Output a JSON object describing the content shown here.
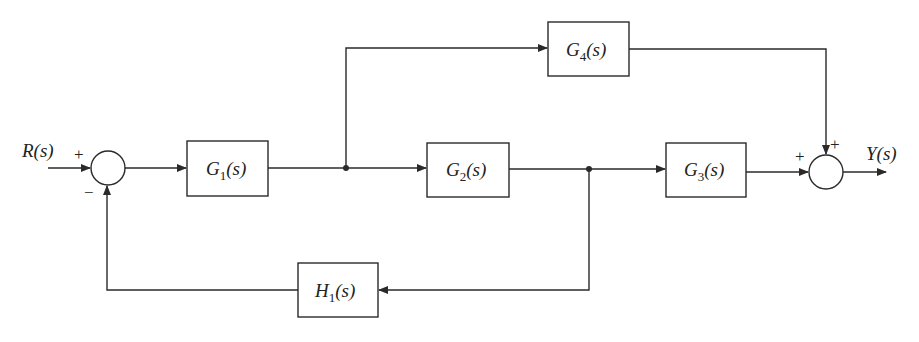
{
  "diagram": {
    "type": "control-system-block-diagram",
    "input": {
      "label": "R(s)"
    },
    "output": {
      "label": "Y(s)"
    },
    "blocks": [
      {
        "id": "G1",
        "name": "G",
        "sub": "1",
        "arg": "(s)"
      },
      {
        "id": "G2",
        "name": "G",
        "sub": "2",
        "arg": "(s)"
      },
      {
        "id": "G3",
        "name": "G",
        "sub": "3",
        "arg": "(s)"
      },
      {
        "id": "G4",
        "name": "G",
        "sub": "4",
        "arg": "(s)"
      },
      {
        "id": "H1",
        "name": "H",
        "sub": "1",
        "arg": "(s)"
      }
    ],
    "summing_junctions": [
      {
        "id": "S1",
        "signs": {
          "input": "+",
          "feedback": "−"
        }
      },
      {
        "id": "S2",
        "signs": {
          "forward": "+",
          "feedforward": "+"
        }
      }
    ],
    "connections": [
      "R(s) → S1 (+)",
      "S1 → G1",
      "G1 → branch A",
      "branch A → G2",
      "branch A → G4",
      "G2 → branch B",
      "branch B → G3",
      "branch B → H1",
      "H1 → S1 (−)",
      "G3 → S2 (+)",
      "G4 → S2 (+)",
      "S2 → Y(s)"
    ]
  }
}
